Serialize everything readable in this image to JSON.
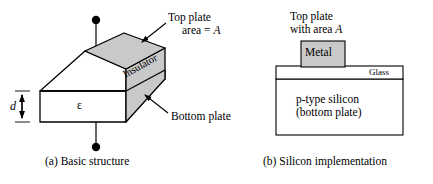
{
  "figure": {
    "panel_a": {
      "caption": "(a) Basic structure",
      "labels": {
        "top_plate_line1": "Top plate",
        "top_plate_line2": "area = ",
        "top_plate_area_symbol": "A",
        "bottom_plate": "Bottom plate",
        "insulator": "Insulator",
        "permittivity_symbol": "ε",
        "thickness_symbol": "d"
      },
      "colors": {
        "top_face_fill": "#c9c9c9",
        "side_face_fill": "#c9c9c9",
        "front_face_fill": "#ffffff",
        "stroke": "#000000"
      },
      "geometry": {
        "top_face_points": "85,51 124,33 165,48 126,69",
        "front_face_points": "40,91 126,91 126,122 40,122",
        "side_face_points": "126,91 165,48 165,79 126,122",
        "left_face_points": "40,91 85,51 126,69 126,91",
        "top_terminal_dot": [
          96,
          20
        ],
        "bottom_terminal_dot": [
          96,
          147
        ],
        "dimension_x": 22
      }
    },
    "panel_b": {
      "caption": "(b) Silicon implementation",
      "labels": {
        "top_plate_line1": "Top plate",
        "top_plate_line2": "with area ",
        "top_plate_area_symbol": "A",
        "metal": "Metal",
        "glass": "Glass",
        "silicon_line1": "p-type silicon",
        "silicon_line2": "(bottom plate)"
      },
      "colors": {
        "metal_fill": "#c9c9c9",
        "glass_fill": "#ffffff",
        "silicon_fill": "#ffffff",
        "stroke": "#000000"
      },
      "geometry": {
        "metal_box": [
          301,
          41,
          44,
          32
        ],
        "glass_box": [
          276,
          66,
          127,
          13
        ],
        "silicon_box": [
          276,
          79,
          127,
          56
        ]
      }
    }
  }
}
